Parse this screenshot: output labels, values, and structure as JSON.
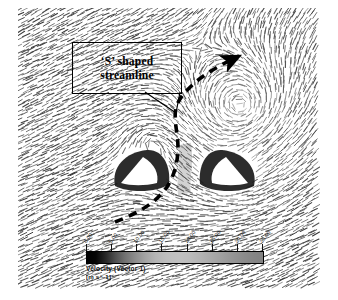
{
  "figure": {
    "kind": "velocity-vector-field",
    "background_color": "#ffffff"
  },
  "annotation": {
    "line1": "‘S’ shaped",
    "line2": "streamline",
    "box_border_color": "#000000",
    "leader_color": "#000000"
  },
  "streamline": {
    "label": "S shaped streamline",
    "style": "dashed",
    "color": "#000000",
    "has_arrowhead": true
  },
  "colorbar": {
    "title": "Velocity (Vector 1)",
    "units": "[m s^-1]",
    "min": 0.0,
    "max": 35.0,
    "tick_labels": [
      "0.00",
      "5.00",
      "10.00",
      "15.00",
      "20.00",
      "25.00",
      "30.00",
      "35.00"
    ],
    "tick_values": [
      0,
      5,
      10,
      15,
      20,
      25,
      30,
      35
    ],
    "low_color": "#000000",
    "high_color": "#828282",
    "orientation": "horizontal"
  },
  "chart_data": {
    "type": "heatmap",
    "title": "Velocity (Vector 1)",
    "xlabel": "",
    "ylabel": "",
    "colorbar_label": "Velocity (Vector 1) [m s^-1]",
    "colorbar_ticks": [
      0,
      5,
      10,
      15,
      20,
      25,
      30,
      35
    ],
    "colorbar_tick_labels": [
      "0.00",
      "5.00",
      "10.00",
      "15.00",
      "20.00",
      "25.00",
      "30.00",
      "35.00"
    ],
    "value_range": [
      0.0,
      35.0
    ],
    "grid": false,
    "legend_position": "bottom",
    "annotations": [
      {
        "text": "‘S’ shaped streamline",
        "x": 126,
        "y": 67,
        "points_to": [
          175,
          113
        ]
      }
    ],
    "features": [
      {
        "name": "vortex",
        "center_x": 240,
        "center_y": 105,
        "rotation": "counter-clockwise"
      },
      {
        "name": "body-left",
        "center_x": 141,
        "center_y": 170,
        "shape": "wedge"
      },
      {
        "name": "body-right",
        "center_x": 228,
        "center_y": 170,
        "shape": "wedge"
      },
      {
        "name": "s-shaped-streamline",
        "start_x": 115,
        "start_y": 222,
        "end_x": 238,
        "end_y": 55
      }
    ]
  }
}
